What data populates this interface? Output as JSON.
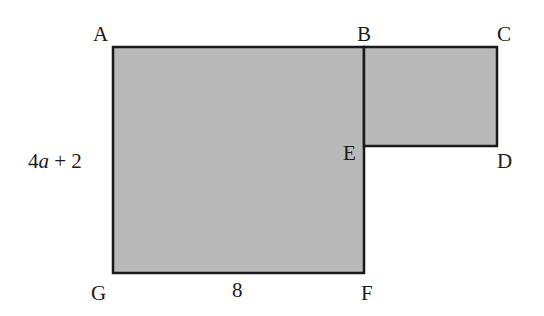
{
  "figure": {
    "fill_color": "#b9b9b9",
    "stroke_color": "#1a1a1a",
    "large_rect": {
      "x": 113,
      "y": 47,
      "w": 251,
      "h": 226
    },
    "small_rect": {
      "x": 364,
      "y": 47,
      "w": 133,
      "h": 99
    },
    "points": {
      "A": "A",
      "B": "B",
      "C": "C",
      "D": "D",
      "E": "E",
      "F": "F",
      "G": "G"
    },
    "side_labels": {
      "left_coef": "4",
      "left_var": "a",
      "left_rest": " + 2",
      "bottom": "8"
    }
  }
}
